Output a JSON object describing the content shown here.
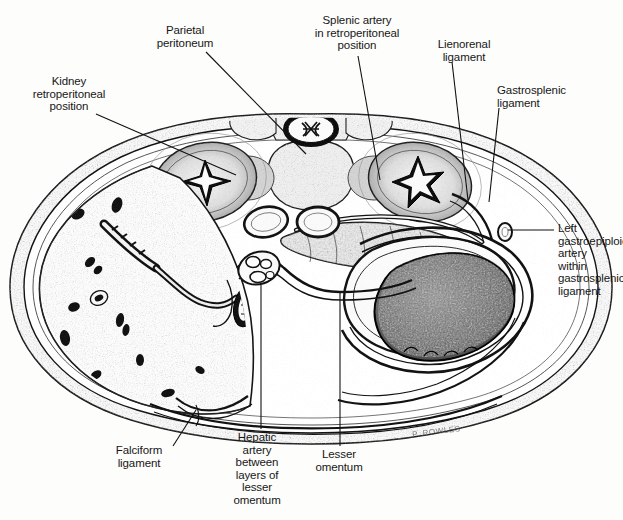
{
  "figure": {
    "domain": "anatomical-illustration",
    "technique": "pen-and-ink stipple",
    "signature": "P. ROWLES",
    "ink_color": "#141414",
    "paper_color": "#fdfdfc"
  },
  "labels": [
    {
      "id": "kidney",
      "text": "Kidney\nretroperitoneal\nposition",
      "align": "center",
      "x": 10,
      "y": 75,
      "w": 118,
      "leader": [
        [
          96,
          114
        ],
        [
          236,
          175
        ]
      ]
    },
    {
      "id": "parietal-peritoneum",
      "text": "Parietal\nperitoneum",
      "align": "center",
      "x": 133,
      "y": 24,
      "w": 104,
      "leader": [
        [
          206,
          52
        ],
        [
          306,
          154
        ]
      ]
    },
    {
      "id": "splenic-artery",
      "text": "Splenic artery\nin retroperitoneal\nposition",
      "align": "center",
      "x": 290,
      "y": 14,
      "w": 134,
      "leader": [
        [
          358,
          56
        ],
        [
          380,
          180
        ]
      ]
    },
    {
      "id": "lienorenal-ligament",
      "text": "Lienorenal\nligament",
      "align": "center",
      "x": 418,
      "y": 38,
      "w": 92,
      "leader": [
        [
          452,
          62
        ],
        [
          468,
          200
        ]
      ]
    },
    {
      "id": "gastrosplenic-ligament",
      "text": "Gastrosplenic\nligament",
      "align": "left",
      "x": 497,
      "y": 84,
      "w": 112,
      "leader": [
        [
          499,
          108
        ],
        [
          489,
          200
        ]
      ]
    },
    {
      "id": "left-gastroepiploic-artery",
      "text": "Left\ngastroepiploic\nartery\nwithin\ngastrosplenic\nligament",
      "align": "left",
      "x": 556,
      "y": 222,
      "w": 78,
      "leader": [
        [
          554,
          230
        ],
        [
          510,
          230
        ]
      ]
    },
    {
      "id": "lesser-omentum",
      "text": "Lesser\nomentum",
      "align": "center",
      "x": 300,
      "y": 448,
      "w": 78,
      "leader": [
        [
          340,
          446
        ],
        [
          340,
          292
        ]
      ]
    },
    {
      "id": "hepatic-artery",
      "text": "Hepatic\nartery\nbetween\nlayers of\nlesser\nomentum",
      "align": "center",
      "x": 215,
      "y": 431,
      "w": 84,
      "leader": [
        [
          261,
          429
        ],
        [
          261,
          285
        ]
      ]
    },
    {
      "id": "falciform-ligament",
      "text": "Falciform\nligament",
      "align": "center",
      "x": 99,
      "y": 444,
      "w": 80,
      "leader": [
        [
          173,
          446
        ],
        [
          196,
          412
        ]
      ]
    }
  ],
  "structures": [
    {
      "id": "body-wall",
      "name": "Anterior abdominal wall / parietal peritoneum"
    },
    {
      "id": "vertebra",
      "name": "Lumbar vertebra with spinal cord"
    },
    {
      "id": "kidney-right",
      "name": "Right kidney (image left) with renal pelvis"
    },
    {
      "id": "kidney-left",
      "name": "Left kidney (image right) with renal pelvis"
    },
    {
      "id": "liver",
      "name": "Liver with intrahepatic vessels"
    },
    {
      "id": "stomach",
      "name": "Stomach"
    },
    {
      "id": "spleen",
      "name": "Spleen"
    },
    {
      "id": "pancreas",
      "name": "Pancreas"
    },
    {
      "id": "aorta",
      "name": "Abdominal aorta"
    },
    {
      "id": "inferior-vena-cava",
      "name": "Inferior vena cava"
    },
    {
      "id": "lesser-omentum-sac",
      "name": "Lesser omentum enclosing hepatic artery"
    },
    {
      "id": "falciform",
      "name": "Falciform ligament"
    }
  ]
}
